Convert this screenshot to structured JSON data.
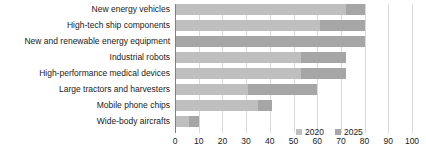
{
  "chart_data": {
    "type": "bar",
    "orientation": "horizontal",
    "stacked": true,
    "title": "",
    "xlabel": "",
    "ylabel": "",
    "xlim": [
      0,
      100
    ],
    "xticks": [
      0,
      10,
      20,
      30,
      40,
      50,
      60,
      70,
      80,
      90,
      100
    ],
    "grid": true,
    "legend_position": "bottom-right",
    "categories": [
      "New energy vehicles",
      "High-tech ship components",
      "New and renewable energy equipment",
      "Industrial robots",
      "High-performance medical devices",
      "Large tractors and harvesters",
      "Mobile phone chips",
      "Wide-body aircrafts"
    ],
    "series": [
      {
        "name": "2020",
        "color": "#bfbfbf",
        "values": [
          72,
          61,
          0,
          53,
          53,
          31,
          35,
          6
        ]
      },
      {
        "name": "2025",
        "color": "#a6a6a6",
        "values": [
          8,
          19,
          80,
          19,
          19,
          29,
          6,
          4
        ]
      }
    ],
    "totals": [
      80,
      80,
      80,
      72,
      72,
      60,
      41,
      10
    ]
  },
  "legend": {
    "items": [
      {
        "label": "2020",
        "color": "#bfbfbf"
      },
      {
        "label": "2025",
        "color": "#a6a6a6"
      }
    ]
  }
}
